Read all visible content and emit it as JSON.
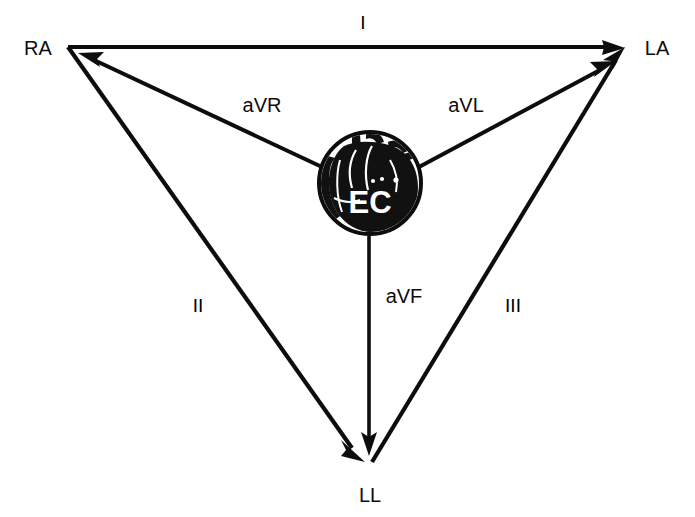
{
  "figure": {
    "background_color": "#ffffff",
    "line_color": "#0d0d0d",
    "heart_fill": "#111111",
    "heart_text_color": "#ffffff"
  },
  "vertices": {
    "right_arm": {
      "label": "RA",
      "x": 68,
      "y": 47
    },
    "left_arm": {
      "label": "LA",
      "x": 625,
      "y": 48
    },
    "left_leg": {
      "label": "LL",
      "x": 370,
      "y": 463
    }
  },
  "heart": {
    "label": "EC",
    "center_x": 370,
    "center_y": 183,
    "radius": 52
  },
  "leads": {
    "lead_1": {
      "label": "I",
      "from": "RA",
      "to": "LA",
      "label_x": 363,
      "label_y": 29
    },
    "lead_2": {
      "label": "II",
      "from": "RA",
      "to": "LL",
      "label_x": 198,
      "label_y": 312
    },
    "lead_3": {
      "label": "III",
      "from": "LL",
      "to": "LA",
      "label_x": 513,
      "label_y": 312
    },
    "lead_avr": {
      "label": "aVR",
      "from": "EC",
      "to": "RA",
      "label_x": 262,
      "label_y": 112
    },
    "lead_avl": {
      "label": "aVL",
      "from": "EC",
      "to": "LA",
      "label_x": 466,
      "label_y": 112
    },
    "lead_avf": {
      "label": "aVF",
      "from": "EC",
      "to": "LL",
      "label_x": 404,
      "label_y": 303
    }
  }
}
